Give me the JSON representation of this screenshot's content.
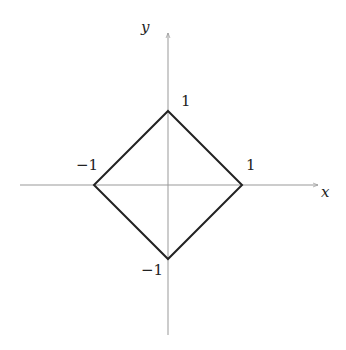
{
  "diagram": {
    "axes": {
      "x_label": "x",
      "y_label": "y",
      "axis_color": "#999999"
    },
    "shape": {
      "type": "diamond",
      "vertices": [
        {
          "name": "top",
          "x": 0,
          "y": 1
        },
        {
          "name": "right",
          "x": 1,
          "y": 0
        },
        {
          "name": "bottom",
          "x": 0,
          "y": -1
        },
        {
          "name": "left",
          "x": -1,
          "y": 0
        }
      ],
      "stroke_color": "#222222"
    },
    "tick_labels": {
      "y_pos": "1",
      "x_pos": "1",
      "x_neg": "−1",
      "y_neg": "−1"
    }
  }
}
